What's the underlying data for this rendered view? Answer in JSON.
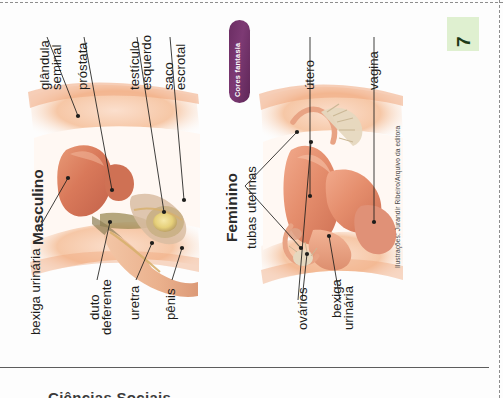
{
  "page": {
    "number": "7",
    "credit": "Ilustrações: Jurandir Ribeiro/Arquivo da editora",
    "cut_text": "Ciências Sociais",
    "badge_label": "Cores fantasia",
    "accent_purple": "#6b2d63",
    "page_chip_green": "#dff0d0",
    "label_color": "#1d1d1b"
  },
  "male": {
    "title": "Masculino",
    "labels": [
      {
        "id": "glandula-seminal",
        "text_line1": "glândula",
        "text_line2": "seminal"
      },
      {
        "id": "prostata",
        "text_line1": "próstata",
        "text_line2": ""
      },
      {
        "id": "testiculo-esquerdo",
        "text_line1": "testículo",
        "text_line2": "esquerdo"
      },
      {
        "id": "saco-escrotal",
        "text_line1": "saco",
        "text_line2": "escrotal"
      },
      {
        "id": "bexiga-urinaria",
        "text_line1": "bexiga urinária",
        "text_line2": ""
      },
      {
        "id": "duto-deferente",
        "text_line1": "duto",
        "text_line2": "deferente"
      },
      {
        "id": "uretra",
        "text_line1": "uretra",
        "text_line2": ""
      },
      {
        "id": "penis",
        "text_line1": "pênis",
        "text_line2": ""
      }
    ]
  },
  "female": {
    "title": "Feminino",
    "labels": [
      {
        "id": "tubas-uterinas",
        "text_line1": "tubas uterinas",
        "text_line2": ""
      },
      {
        "id": "utero",
        "text_line1": "útero",
        "text_line2": ""
      },
      {
        "id": "vagina",
        "text_line1": "vagina",
        "text_line2": ""
      },
      {
        "id": "ovarios",
        "text_line1": "ovários",
        "text_line2": ""
      },
      {
        "id": "bexiga-urinaria-f",
        "text_line1": "bexiga",
        "text_line2": "urinária"
      }
    ]
  }
}
